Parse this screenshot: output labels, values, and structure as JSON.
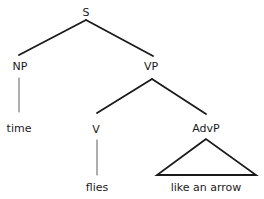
{
  "diagram": {
    "type": "syntax-tree",
    "nodes": {
      "s": {
        "label": "S",
        "x": 86,
        "y": 12
      },
      "np": {
        "label": "NP",
        "x": 20,
        "y": 66
      },
      "vp": {
        "label": "VP",
        "x": 151,
        "y": 66
      },
      "time": {
        "label": "time",
        "x": 19,
        "y": 128
      },
      "v": {
        "label": "V",
        "x": 96,
        "y": 129
      },
      "advp": {
        "label": "AdvP",
        "x": 206,
        "y": 128
      },
      "flies": {
        "label": "flies",
        "x": 97,
        "y": 187
      },
      "arrow": {
        "label": "like an arrow",
        "x": 206,
        "y": 187
      }
    },
    "edges": [
      {
        "from": "S",
        "to": "NP",
        "style": "thick"
      },
      {
        "from": "S",
        "to": "VP",
        "style": "thick"
      },
      {
        "from": "NP",
        "to": "time",
        "style": "thin"
      },
      {
        "from": "VP",
        "to": "V",
        "style": "thick"
      },
      {
        "from": "VP",
        "to": "AdvP",
        "style": "thick"
      },
      {
        "from": "V",
        "to": "flies",
        "style": "thin"
      },
      {
        "from": "AdvP",
        "to": "like an arrow",
        "style": "triangle"
      }
    ],
    "colors": {
      "line": "#1a1a1a",
      "text": "#1a1a1a",
      "background": "#ffffff"
    }
  }
}
